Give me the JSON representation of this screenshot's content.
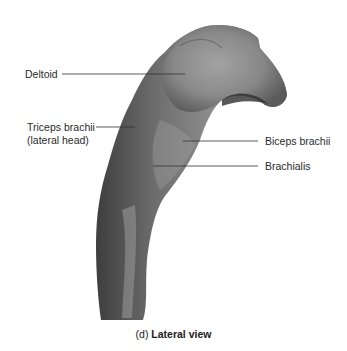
{
  "figure": {
    "caption_prefix": "(d)",
    "caption_title": "Lateral view"
  },
  "labels": [
    {
      "id": "deltoid",
      "text": "Deltoid"
    },
    {
      "id": "triceps-brachii",
      "text": "Triceps brachii",
      "text2": "(lateral head)"
    },
    {
      "id": "biceps-brachii",
      "text": "Biceps brachii"
    },
    {
      "id": "brachialis",
      "text": "Brachialis"
    }
  ],
  "colors": {
    "background": "#ffffff",
    "leader_line": "#333333",
    "muscle_light": "#a8a8a8",
    "muscle_mid": "#7e7e7e",
    "muscle_dark": "#4a4a4a"
  }
}
